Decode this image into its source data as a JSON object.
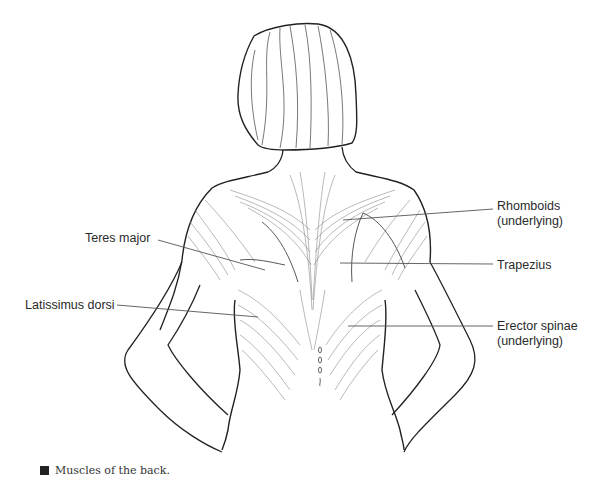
{
  "figure": {
    "colors": {
      "line": "#222222",
      "fiber": "#7a7a7a",
      "leader": "#555555",
      "background": "#ffffff"
    }
  },
  "labels": {
    "left": [
      {
        "id": "teres-major",
        "text": "Teres major"
      },
      {
        "id": "latissimus-dorsi",
        "text": "Latissimus dorsi"
      }
    ],
    "right": [
      {
        "id": "rhomboids",
        "line1": "Rhomboids",
        "line2": "(underlying)"
      },
      {
        "id": "trapezius",
        "text": "Trapezius"
      },
      {
        "id": "erector-spinae",
        "line1": "Erector spinae",
        "line2": "(underlying)"
      }
    ]
  },
  "caption": {
    "bullet": "square-bullet-icon",
    "text": "Muscles of the back."
  }
}
